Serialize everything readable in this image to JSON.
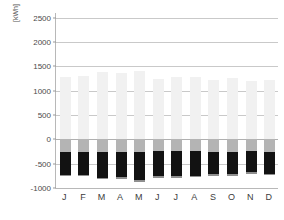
{
  "chart_data": {
    "type": "bar",
    "title": "",
    "subtitle": "",
    "xlabel": "",
    "ylabel": "[kWh]",
    "yunit": "[kWh]",
    "ylim": [
      -1000,
      2600
    ],
    "ytick_values": [
      2500,
      2000,
      1500,
      1000,
      500,
      0,
      -500,
      -1000
    ],
    "ytick_labels": [
      "2500",
      "2000",
      "1500",
      "1000",
      "500",
      "0",
      "-500",
      "-1000"
    ],
    "grid": true,
    "legend": "none",
    "stacked": true,
    "categories": [
      "J",
      "F",
      "M",
      "A",
      "M",
      "J",
      "J",
      "A",
      "S",
      "O",
      "N",
      "D"
    ],
    "category_names": [
      "January",
      "February",
      "March",
      "April",
      "May",
      "June",
      "July",
      "August",
      "September",
      "October",
      "November",
      "December"
    ],
    "series": [
      {
        "name": "positive-light",
        "color": "#f1f1f1",
        "values": [
          1290,
          1300,
          1380,
          1370,
          1400,
          1250,
          1290,
          1290,
          1230,
          1260,
          1200,
          1215
        ]
      },
      {
        "name": "negative-gray-upper",
        "color": "#b4b4b4",
        "values": [
          -255,
          -255,
          -255,
          -255,
          -255,
          -245,
          -245,
          -245,
          -250,
          -250,
          -245,
          -250
        ]
      },
      {
        "name": "negative-black",
        "color": "#121212",
        "values": [
          -470,
          -470,
          -530,
          -520,
          -580,
          -510,
          -505,
          -500,
          -470,
          -470,
          -435,
          -455
        ]
      },
      {
        "name": "negative-gray-lower",
        "color": "#8f8f8f",
        "values": [
          -30,
          -35,
          -40,
          -40,
          -40,
          -35,
          -35,
          -35,
          -35,
          -35,
          -25,
          -35
        ]
      }
    ],
    "bar_totals_positive": [
      1290,
      1300,
      1380,
      1370,
      1400,
      1250,
      1290,
      1290,
      1230,
      1260,
      1200,
      1215
    ],
    "bar_totals_negative": [
      -755,
      -760,
      -825,
      -815,
      -875,
      -790,
      -785,
      -780,
      -755,
      -755,
      -705,
      -740
    ]
  },
  "colors": {
    "background": "#ffffff",
    "grid": "#c9c9c9",
    "axis": "#b8b8b8",
    "tick_text": "#4a4a4a",
    "positive_bar": "#f1f1f1",
    "negative_bar_upper": "#b4b4b4",
    "negative_bar_main": "#121212",
    "negative_bar_lower": "#8f8f8f"
  }
}
